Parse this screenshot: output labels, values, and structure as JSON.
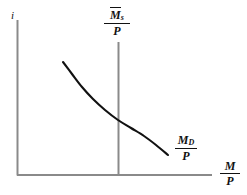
{
  "figure": {
    "type": "economics-diagram",
    "background_color": "#ffffff",
    "axis_color": "#8a8a8a",
    "curve_color": "#111111",
    "label_color": "#111111"
  },
  "labels": {
    "y_axis": "i",
    "x_axis": {
      "numerator": "M",
      "denominator": "P"
    },
    "money_supply": {
      "numerator": "M",
      "numerator_sub": "s",
      "numerator_overbar": true,
      "denominator": "P"
    },
    "money_demand": {
      "numerator": "M",
      "numerator_sub": "D",
      "numerator_overbar": false,
      "denominator": "P"
    }
  },
  "chart_data": {
    "type": "line",
    "xlabel": "M/P",
    "ylabel": "i",
    "grid": false,
    "legend": "inline-curve-labels",
    "axes": {
      "origin": [
        17,
        175
      ],
      "y_axis_top": [
        17,
        20
      ],
      "x_axis_right": [
        212,
        175
      ]
    },
    "series": [
      {
        "name": "M_D/P",
        "kind": "curve",
        "description": "Downward sloping convex money demand curve",
        "points": [
          [
            63,
            62
          ],
          [
            72,
            74
          ],
          [
            82,
            87
          ],
          [
            93,
            99
          ],
          [
            105,
            110
          ],
          [
            118,
            120
          ],
          [
            131,
            128
          ],
          [
            144,
            136
          ],
          [
            156,
            145
          ],
          [
            168,
            155
          ]
        ]
      },
      {
        "name": "Mbar_s/P",
        "kind": "vertical-line",
        "description": "Fixed real money supply, vertical line",
        "x": 118,
        "y_top": 42,
        "y_bottom": 175
      }
    ],
    "intersection": [
      118,
      120
    ]
  }
}
